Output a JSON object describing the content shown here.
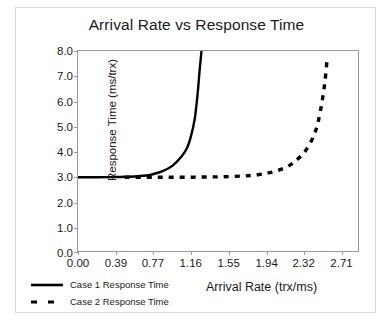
{
  "chart_data": {
    "type": "line",
    "title": "Arrival Rate vs Response Time",
    "xlabel": "Arrival Rate (trx/ms)",
    "ylabel": "Response Time (ms/trx)",
    "xlim": [
      0.0,
      2.9
    ],
    "ylim": [
      0.0,
      8.0
    ],
    "grid": false,
    "legend_position": "bottom-left",
    "xticks": [
      "0.00",
      "0.39",
      "0.77",
      "1.16",
      "1.55",
      "1.94",
      "2.32",
      "2.71"
    ],
    "xtick_values": [
      0.0,
      0.39,
      0.77,
      1.16,
      1.55,
      1.94,
      2.32,
      2.71
    ],
    "yticks": [
      "0.0",
      "1.0",
      "2.0",
      "3.0",
      "4.0",
      "5.0",
      "6.0",
      "7.0",
      "8.0"
    ],
    "ytick_values": [
      0.0,
      1.0,
      2.0,
      3.0,
      4.0,
      5.0,
      6.0,
      7.0,
      8.0
    ],
    "series": [
      {
        "name": "Case 1 Response Time",
        "style": "solid",
        "color": "#000000",
        "x": [
          0.0,
          0.2,
          0.39,
          0.58,
          0.7,
          0.77,
          0.87,
          0.97,
          1.06,
          1.12,
          1.16,
          1.2,
          1.23,
          1.25,
          1.27
        ],
        "y": [
          3.0,
          3.0,
          3.01,
          3.03,
          3.07,
          3.12,
          3.24,
          3.45,
          3.8,
          4.15,
          4.6,
          5.3,
          6.3,
          7.2,
          8.0
        ]
      },
      {
        "name": "Case 2 Response Time",
        "style": "dashed",
        "color": "#000000",
        "x": [
          0.48,
          0.7,
          0.9,
          1.1,
          1.3,
          1.5,
          1.7,
          1.85,
          1.97,
          2.08,
          2.18,
          2.26,
          2.34,
          2.42,
          2.47,
          2.51,
          2.54,
          2.56
        ],
        "y": [
          3.0,
          3.0,
          3.0,
          3.0,
          3.01,
          3.02,
          3.05,
          3.1,
          3.18,
          3.3,
          3.48,
          3.72,
          4.05,
          4.6,
          5.2,
          6.0,
          6.8,
          7.6
        ]
      }
    ]
  },
  "legend": {
    "items": [
      {
        "label": "Case 1 Response Time",
        "style": "solid"
      },
      {
        "label": "Case 2 Response Time",
        "style": "dashed"
      }
    ]
  }
}
